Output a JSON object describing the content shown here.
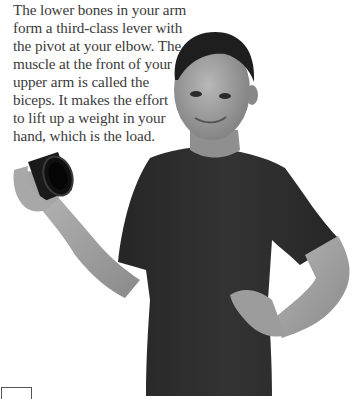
{
  "caption": {
    "lines": [
      "The lower bones in your arm",
      "form a third-class lever with",
      "the pivot at your elbow. The",
      "muscle at the front of your",
      "upper arm is called the",
      "biceps. It makes the effort",
      "to lift up a weight in your",
      "hand, which is the load."
    ]
  },
  "photo": {
    "subject": "girl-holding-can-weight",
    "colors": {
      "shirt": "#2b2b2b",
      "skin": "#9a9a9a",
      "hair": "#1e1e1e",
      "can": "#151515",
      "background": "#ffffff"
    }
  }
}
